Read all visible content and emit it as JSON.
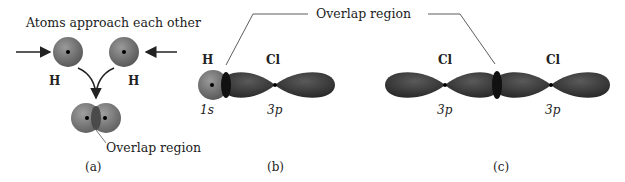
{
  "panels": [
    {
      "id": "a",
      "caption": "(a)",
      "title": "Atoms approach each other",
      "atom_labels": [
        "H",
        "H"
      ],
      "annotation": "Overlap region"
    },
    {
      "id": "b",
      "caption": "(b)",
      "atom_labels": [
        "H",
        "Cl"
      ],
      "orbital_labels": [
        "1s",
        "3p"
      ]
    },
    {
      "id": "c",
      "caption": "(c)",
      "atom_labels": [
        "Cl",
        "Cl"
      ],
      "orbital_labels": [
        "3p",
        "3p"
      ]
    }
  ],
  "shared_annotation": "Overlap region",
  "colors": {
    "s_orbital": "#7a7a7a",
    "p_orbital": "#3a3a3a",
    "background": "#ffffff",
    "text": "#222222"
  }
}
